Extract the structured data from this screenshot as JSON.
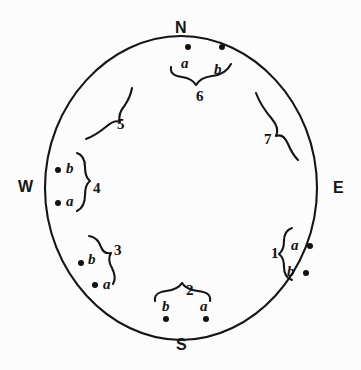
{
  "figure": {
    "background_color": "#fcfcfc",
    "ink_color": "#151515",
    "circle": {
      "cx": 181,
      "cy": 188,
      "rx": 136,
      "ry": 152
    }
  },
  "compass": {
    "north": {
      "label": "N",
      "x": 175,
      "y": 20
    },
    "east": {
      "label": "E",
      "x": 333,
      "y": 180
    },
    "south": {
      "label": "S",
      "x": 176,
      "y": 337
    },
    "west": {
      "label": "W",
      "x": 18,
      "y": 179
    }
  },
  "groups": [
    {
      "id": "group-1",
      "number": "1",
      "number_pos": {
        "x": 271,
        "y": 246
      },
      "brace_orientation": "opens-right",
      "points": [
        {
          "label": "a",
          "label_x": 291,
          "label_y": 238,
          "dot_x": 307,
          "dot_y": 243
        },
        {
          "label": "b",
          "label_x": 287,
          "label_y": 264,
          "dot_x": 303,
          "dot_y": 270
        }
      ]
    },
    {
      "id": "group-2",
      "number": "2",
      "number_pos": {
        "x": 186,
        "y": 283
      },
      "brace_orientation": "opens-down",
      "points": [
        {
          "label": "b",
          "label_x": 162,
          "label_y": 299,
          "dot_x": 163,
          "dot_y": 316
        },
        {
          "label": "a",
          "label_x": 200,
          "label_y": 299,
          "dot_x": 203,
          "dot_y": 316
        }
      ]
    },
    {
      "id": "group-3",
      "number": "3",
      "number_pos": {
        "x": 114,
        "y": 243
      },
      "brace_orientation": "opens-left",
      "points": [
        {
          "label": "b",
          "label_x": 88,
          "label_y": 252,
          "dot_x": 78,
          "dot_y": 260
        },
        {
          "label": "a",
          "label_x": 103,
          "label_y": 277,
          "dot_x": 92,
          "dot_y": 282
        }
      ]
    },
    {
      "id": "group-4",
      "number": "4",
      "number_pos": {
        "x": 93,
        "y": 181
      },
      "brace_orientation": "opens-left",
      "points": [
        {
          "label": "b",
          "label_x": 66,
          "label_y": 161,
          "dot_x": 55,
          "dot_y": 167
        },
        {
          "label": "a",
          "label_x": 66,
          "label_y": 194,
          "dot_x": 55,
          "dot_y": 200
        }
      ]
    },
    {
      "id": "group-5",
      "number": "5",
      "number_pos": {
        "x": 117,
        "y": 117
      },
      "brace_orientation": "diagonal",
      "points": []
    },
    {
      "id": "group-6",
      "number": "6",
      "number_pos": {
        "x": 196,
        "y": 89
      },
      "brace_orientation": "opens-up",
      "points": [
        {
          "label": "a",
          "label_x": 181,
          "label_y": 56,
          "dot_x": 185,
          "dot_y": 44
        },
        {
          "label": "b",
          "label_x": 214,
          "label_y": 62,
          "dot_x": 219,
          "dot_y": 44
        }
      ]
    },
    {
      "id": "group-7",
      "number": "7",
      "number_pos": {
        "x": 264,
        "y": 132
      },
      "brace_orientation": "diagonal",
      "points": []
    }
  ]
}
